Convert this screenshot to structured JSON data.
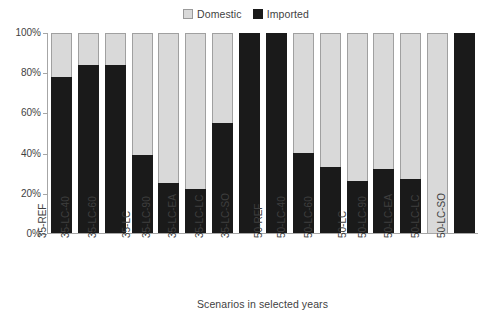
{
  "chart_data": {
    "type": "bar",
    "subtype": "stacked-percentage",
    "title": "",
    "xlabel": "Scenarios in selected years",
    "ylabel": "",
    "ylim": [
      0,
      100
    ],
    "yticks": [
      "0%",
      "20%",
      "40%",
      "60%",
      "80%",
      "100%"
    ],
    "ytick_values": [
      0,
      20,
      40,
      60,
      80,
      100
    ],
    "grid": false,
    "legend_position": "top-center",
    "categories": [
      "35-REF",
      "35-LC-40",
      "35-LC-60",
      "35-LC",
      "35-LC-90",
      "35-LC-EA",
      "35-LC-LC",
      "35-LC-SO",
      "50-REF",
      "50-LC-40",
      "50-LC-60",
      "50-LC",
      "50-LC-90",
      "50-LC-EA",
      "50-LC-LC",
      "50-LC-SO"
    ],
    "series": [
      {
        "name": "Imported",
        "color": "#1a1a1a",
        "values": [
          78,
          84,
          84,
          39,
          25,
          22,
          55,
          100,
          100,
          40,
          33,
          26,
          32,
          27,
          0,
          100
        ]
      },
      {
        "name": "Domestic",
        "color": "#d9d9d9",
        "values": [
          22,
          16,
          16,
          61,
          75,
          78,
          45,
          0,
          0,
          60,
          67,
          74,
          68,
          73,
          100,
          0
        ]
      }
    ]
  },
  "legend": {
    "items": [
      {
        "label": "Domestic",
        "swatch": "domestic-swatch-icon"
      },
      {
        "label": "Imported",
        "swatch": "imported-swatch-icon"
      }
    ]
  }
}
